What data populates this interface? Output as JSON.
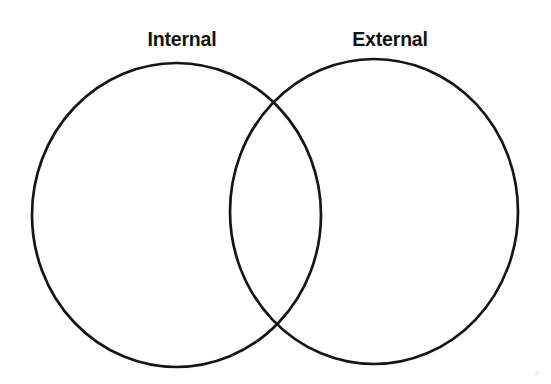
{
  "diagram": {
    "type": "venn",
    "title": "",
    "background_color": "#ffffff",
    "stroke_color": "#151515",
    "stroke_width": 2.7,
    "fill": "none",
    "sets": [
      {
        "id": "internal",
        "label": "Internal",
        "label_position": "top-left",
        "center_x": 176.5,
        "center_y": 215,
        "radius_x": 144.5,
        "radius_y": 152,
        "items": []
      },
      {
        "id": "external",
        "label": "External",
        "label_position": "top-right",
        "center_x": 374,
        "center_y": 211.5,
        "radius_x": 144,
        "radius_y": 152.5,
        "items": []
      }
    ],
    "intersection": {
      "label": "",
      "items": [],
      "top_point_x": 277,
      "top_point_y": 105,
      "bottom_point_x": 276,
      "bottom_point_y": 327
    }
  }
}
